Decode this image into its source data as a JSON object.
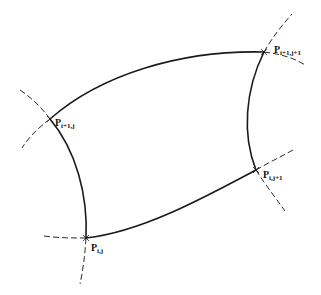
{
  "diagram": {
    "type": "curvilinear grid cell",
    "colors": {
      "curve": "#1a1a1a",
      "extension": "#2a2a2a",
      "text": "#111111",
      "background": "#ffffff"
    },
    "points": [
      {
        "id": "p-i1-j",
        "symbol": "P",
        "subscript": "i+1,j"
      },
      {
        "id": "p-i1-j1",
        "symbol": "P",
        "subscript": "i+1,j+1"
      },
      {
        "id": "p-i-j1",
        "symbol": "P",
        "subscript": "i,j+1"
      },
      {
        "id": "p-i-j",
        "symbol": "P",
        "subscript": "i,j"
      }
    ],
    "edges": [
      {
        "from": "p-i1-j",
        "to": "p-i1-j1",
        "style": "solid"
      },
      {
        "from": "p-i1-j1",
        "to": "p-i-j1",
        "style": "solid"
      },
      {
        "from": "p-i-j1",
        "to": "p-i-j",
        "style": "solid"
      },
      {
        "from": "p-i-j",
        "to": "p-i1-j",
        "style": "solid"
      }
    ],
    "extensions_style": "dashed"
  }
}
